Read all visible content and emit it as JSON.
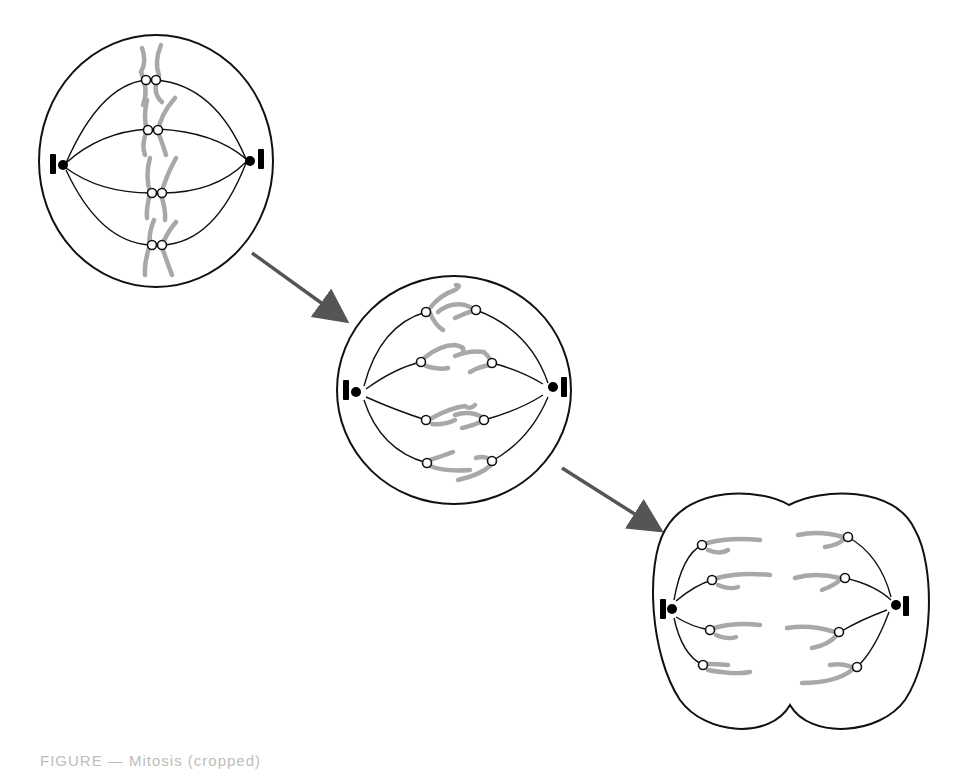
{
  "figure": {
    "caption_partial": "FIGURE — Mitosis (cropped)",
    "colors": {
      "outline": "#111111",
      "chromosome": "#a8a8a8",
      "arrow": "#555555",
      "centrosome": "#000000"
    },
    "stages": [
      {
        "name": "metaphase",
        "chromosome_pairs": 4
      },
      {
        "name": "anaphase",
        "chromosome_pairs": 4
      },
      {
        "name": "telophase",
        "chromosome_pairs": 4
      }
    ],
    "arrows": [
      {
        "from": "metaphase",
        "to": "anaphase"
      },
      {
        "from": "anaphase",
        "to": "telophase"
      }
    ]
  }
}
